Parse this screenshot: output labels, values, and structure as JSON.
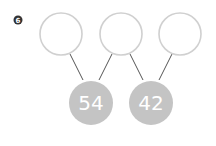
{
  "badge": {
    "label": "6",
    "color": "#333333"
  },
  "top_nodes": [
    {
      "id": "top-1",
      "value": ""
    },
    {
      "id": "top-2",
      "value": ""
    },
    {
      "id": "top-3",
      "value": ""
    }
  ],
  "bottom_nodes": [
    {
      "id": "bottom-1",
      "value": "54",
      "sum_of": [
        "top-1",
        "top-2"
      ]
    },
    {
      "id": "bottom-2",
      "value": "42",
      "sum_of": [
        "top-2",
        "top-3"
      ]
    }
  ],
  "colors": {
    "top_stroke": "#d0d0d0",
    "bottom_fill": "#c4c4c4",
    "connector": "#555555"
  }
}
